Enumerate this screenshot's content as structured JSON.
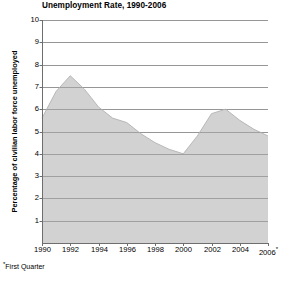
{
  "chart_data": {
    "type": "area",
    "title": "Unemployment Rate, 1990-2006",
    "xlabel": "",
    "ylabel": "Percentage of civilian labor force unemployed",
    "footnote": "*First Quarter",
    "footnote_marker": "*",
    "xlim": [
      1990,
      2006
    ],
    "ylim": [
      0,
      10
    ],
    "y_ticks": [
      10,
      9,
      8,
      7,
      6,
      5,
      4,
      3,
      2,
      1
    ],
    "y_tick_labels": [
      "10",
      "9",
      "8",
      "7",
      "6",
      "5",
      "4",
      "3",
      "2",
      "1"
    ],
    "x_ticks": [
      1990,
      1992,
      1994,
      1996,
      1998,
      2000,
      2002,
      2004,
      2006
    ],
    "x_tick_labels": [
      "1990",
      "1992",
      "1994",
      "1996",
      "1998",
      "2000",
      "2002",
      "2004",
      "2006*"
    ],
    "grid": true,
    "legend": "none",
    "x": [
      1990,
      1991,
      1992,
      1993,
      1994,
      1995,
      1996,
      1997,
      1998,
      1999,
      2000,
      2001,
      2002,
      2003,
      2004,
      2005,
      2006
    ],
    "values": [
      5.6,
      6.8,
      7.5,
      6.9,
      6.1,
      5.6,
      5.4,
      4.9,
      4.5,
      4.2,
      4.0,
      4.8,
      5.8,
      6.0,
      5.5,
      5.1,
      4.8
    ],
    "series": [
      {
        "name": "Unemployment rate",
        "values": [
          5.6,
          6.8,
          7.5,
          6.9,
          6.1,
          5.6,
          5.4,
          4.9,
          4.5,
          4.2,
          4.0,
          4.8,
          5.8,
          6.0,
          5.5,
          5.1,
          4.8
        ]
      }
    ],
    "colors": {
      "area_fill": "#d2d2d2",
      "area_line": "#b8b8b8",
      "gridline": "#8a8a8a",
      "axis": "#6e6e6e",
      "text": "#000000",
      "background": "#ffffff"
    }
  }
}
